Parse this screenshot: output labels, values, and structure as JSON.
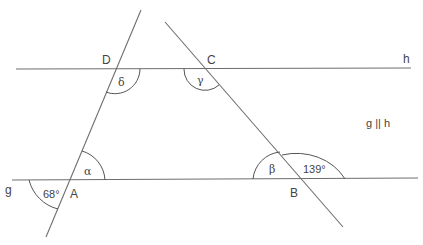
{
  "diagram": {
    "type": "geometry-parallel-lines-transversals",
    "lines": {
      "h": {
        "label": "h"
      },
      "g": {
        "label": "g"
      },
      "relation": "g || h"
    },
    "points": {
      "A": "A",
      "B": "B",
      "C": "C",
      "D": "D"
    },
    "angles": {
      "alpha": "α",
      "beta": "β",
      "gamma": "γ",
      "delta": "δ",
      "given_at_A": "68°",
      "given_at_B": "139°"
    },
    "colors": {
      "line": "#6e6e6e",
      "text": "#444444",
      "background": "#ffffff"
    }
  }
}
